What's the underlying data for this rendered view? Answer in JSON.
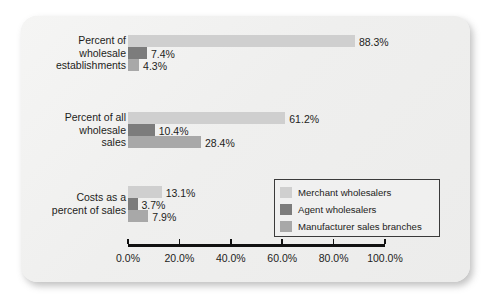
{
  "chart_data": {
    "type": "bar",
    "orientation": "horizontal",
    "title": "",
    "xlabel": "",
    "ylabel": "",
    "xlim": [
      0,
      100
    ],
    "xticks": [
      0,
      20,
      40,
      60,
      80,
      100
    ],
    "xtick_labels": [
      "0.0%",
      "20.0%",
      "40.0%",
      "60.0%",
      "80.0%",
      "100.0%"
    ],
    "grid": false,
    "legend_position": "inside-bottom-right",
    "categories": [
      "Percent of\nwholesale\nestablishments",
      "Percent of all\nwholesale\nsales",
      "Costs as a\npercent of sales"
    ],
    "category_lines": [
      [
        "Percent of",
        "wholesale",
        "establishments"
      ],
      [
        "Percent of all",
        "wholesale",
        "sales"
      ],
      [
        "Costs as a",
        "percent of sales"
      ]
    ],
    "series": [
      {
        "name": "Merchant wholesalers",
        "color": "#cfcfcf",
        "values": [
          88.3,
          61.2,
          13.1
        ],
        "labels": [
          "88.3%",
          "61.2%",
          "13.1%"
        ]
      },
      {
        "name": "Agent wholesalers",
        "color": "#7c7c7c",
        "values": [
          7.4,
          10.4,
          3.7
        ],
        "labels": [
          "7.4%",
          "10.4%",
          "3.7%"
        ]
      },
      {
        "name": "Manufacturer sales branches",
        "color": "#a8a8a8",
        "values": [
          4.3,
          28.4,
          7.9
        ],
        "labels": [
          "4.3%",
          "28.4%",
          "7.9%"
        ]
      }
    ]
  },
  "legend": {
    "items": [
      {
        "label": "Merchant wholesalers",
        "color": "#cfcfcf"
      },
      {
        "label": "Agent wholesalers",
        "color": "#7c7c7c"
      },
      {
        "label": "Manufacturer sales branches",
        "color": "#a8a8a8"
      }
    ]
  },
  "axis": {
    "ticks": [
      {
        "value": 0,
        "label": "0.0%"
      },
      {
        "value": 20,
        "label": "20.0%"
      },
      {
        "value": 40,
        "label": "40.0%"
      },
      {
        "value": 60,
        "label": "60.0%"
      },
      {
        "value": 80,
        "label": "80.0%"
      },
      {
        "value": 100,
        "label": "100.0%"
      }
    ]
  },
  "style": {
    "card_background": "#f1f1f0",
    "axis_color": "#111111",
    "text_color": "#1d1d1b"
  }
}
